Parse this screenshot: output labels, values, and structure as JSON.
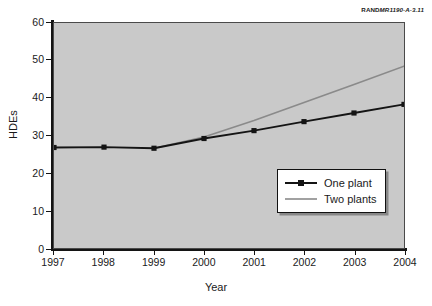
{
  "source_credit": {
    "organization": "RAND",
    "document_id": "MR1190-A-3.11"
  },
  "chart_data": {
    "type": "line",
    "title": "",
    "xlabel": "Year",
    "ylabel": "HDEs",
    "x": [
      1997,
      1998,
      1999,
      2000,
      2001,
      2002,
      2003,
      2004
    ],
    "categories": [
      "1997",
      "1998",
      "1999",
      "2000",
      "2001",
      "2002",
      "2003",
      "2004"
    ],
    "xlim": [
      1997,
      2004
    ],
    "ylim": [
      0,
      60
    ],
    "y_ticks": [
      0,
      10,
      20,
      30,
      40,
      50,
      60
    ],
    "x_ticks": [
      1997,
      1998,
      1999,
      2000,
      2001,
      2002,
      2003,
      2004
    ],
    "grid": false,
    "legend_position": "center-right",
    "plot_background": "#c9c9c9",
    "series": [
      {
        "name": "One plant",
        "color": "#141414",
        "marker": "square",
        "values": [
          26.8,
          26.9,
          26.6,
          29.2,
          31.3,
          33.7,
          36.0,
          38.3
        ]
      },
      {
        "name": "Two plants",
        "color": "#8a8a8a",
        "marker": "none",
        "values": [
          null,
          null,
          26.6,
          29.6,
          34.0,
          38.8,
          43.6,
          48.5
        ]
      }
    ],
    "legend": [
      {
        "label": "One plant",
        "color": "#141414",
        "marker": "square"
      },
      {
        "label": "Two plants",
        "color": "#8a8a8a",
        "marker": "none"
      }
    ]
  }
}
